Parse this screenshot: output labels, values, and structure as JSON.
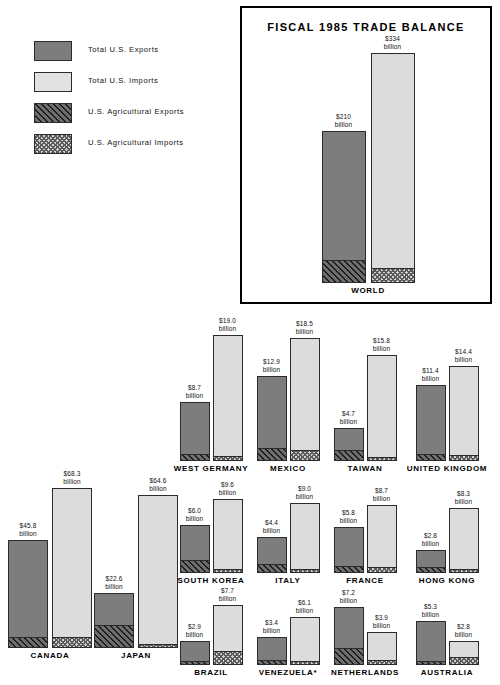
{
  "legend": {
    "items": [
      {
        "label": "Total U.S. Exports",
        "swatch": "solid-dark-gray"
      },
      {
        "label": "Total U.S. Imports",
        "swatch": "solid-light-gray"
      },
      {
        "label": "U.S. Agricultural Exports",
        "swatch": "diagonal-hatch"
      },
      {
        "label": "U.S. Agricultural Imports",
        "swatch": "checkerboard"
      }
    ]
  },
  "world_panel": {
    "title": "FISCAL 1985 TRADE BALANCE",
    "country": "WORLD",
    "export_label": "$210",
    "export_unit": "billion",
    "import_label": "$334",
    "import_unit": "billion"
  },
  "unit_word": "billion",
  "colors": {
    "exports": "#7d7d7d",
    "imports": "#dcdcdc",
    "outline": "#2b2b2b",
    "panel_border": "#000000"
  },
  "chart_data": {
    "type": "bar",
    "title": "FISCAL 1985 TRADE BALANCE",
    "subtitle": "",
    "xlabel": "",
    "ylabel": "",
    "units": "billions of U.S. dollars",
    "grid": false,
    "legend_position": "top-left",
    "series": [
      {
        "name": "Total U.S. Exports",
        "key": "exports"
      },
      {
        "name": "Total U.S. Imports",
        "key": "imports"
      },
      {
        "name": "U.S. Agricultural Exports",
        "key": "ag_exports"
      },
      {
        "name": "U.S. Agricultural Imports",
        "key": "ag_imports"
      }
    ],
    "categories": [
      "WORLD",
      "CANADA",
      "JAPAN",
      "WEST GERMANY",
      "MEXICO",
      "TAIWAN",
      "UNITED KINGDOM",
      "SOUTH KOREA",
      "ITALY",
      "FRANCE",
      "HONG KONG",
      "BRAZIL",
      "VENEZUELA*",
      "NETHERLANDS",
      "AUSTRALIA"
    ],
    "points": [
      {
        "country": "WORLD",
        "exports": 210,
        "imports": 334,
        "export_text": "$210",
        "import_text": "$334",
        "ag_export_frac": 0.145,
        "ag_import_frac": 0.06
      },
      {
        "country": "CANADA",
        "exports": 45.8,
        "imports": 68.3,
        "export_text": "$45.8",
        "import_text": "$68.3",
        "ag_export_frac": 0.095,
        "ag_import_frac": 0.065
      },
      {
        "country": "JAPAN",
        "exports": 22.6,
        "imports": 64.6,
        "export_text": "$22.6",
        "import_text": "$64.6",
        "ag_export_frac": 0.4,
        "ag_import_frac": 0.012
      },
      {
        "country": "WEST GERMANY",
        "exports": 8.7,
        "imports": 19.0,
        "export_text": "$8.7",
        "import_text": "$19.0",
        "ag_export_frac": 0.1,
        "ag_import_frac": 0.035
      },
      {
        "country": "MEXICO",
        "exports": 12.9,
        "imports": 18.5,
        "export_text": "$12.9",
        "import_text": "$18.5",
        "ag_export_frac": 0.145,
        "ag_import_frac": 0.085
      },
      {
        "country": "TAIWAN",
        "exports": 4.7,
        "imports": 15.8,
        "export_text": "$4.7",
        "import_text": "$15.8",
        "ag_export_frac": 0.29,
        "ag_import_frac": 0.025
      },
      {
        "country": "UNITED KINGDOM",
        "exports": 11.4,
        "imports": 14.4,
        "export_text": "$11.4",
        "import_text": "$14.4",
        "ag_export_frac": 0.075,
        "ag_import_frac": 0.055
      },
      {
        "country": "SOUTH KOREA",
        "exports": 6.0,
        "imports": 9.6,
        "export_text": "$6.0",
        "import_text": "$9.6",
        "ag_export_frac": 0.26,
        "ag_import_frac": 0.035
      },
      {
        "country": "ITALY",
        "exports": 4.4,
        "imports": 9.0,
        "export_text": "$4.4",
        "import_text": "$9.0",
        "ag_export_frac": 0.22,
        "ag_import_frac": 0.045
      },
      {
        "country": "FRANCE",
        "exports": 5.8,
        "imports": 8.7,
        "export_text": "$5.8",
        "import_text": "$8.7",
        "ag_export_frac": 0.13,
        "ag_import_frac": 0.075
      },
      {
        "country": "HONG KONG",
        "exports": 2.8,
        "imports": 8.3,
        "export_text": "$2.8",
        "import_text": "$8.3",
        "ag_export_frac": 0.22,
        "ag_import_frac": 0.018
      },
      {
        "country": "BRAZIL",
        "exports": 2.9,
        "imports": 7.7,
        "export_text": "$2.9",
        "import_text": "$7.7",
        "ag_export_frac": 0.12,
        "ag_import_frac": 0.22
      },
      {
        "country": "VENEZUELA*",
        "exports": 3.4,
        "imports": 6.1,
        "export_text": "$3.4",
        "import_text": "$6.1",
        "ag_export_frac": 0.16,
        "ag_import_frac": 0.02
      },
      {
        "country": "NETHERLANDS",
        "exports": 7.2,
        "imports": 3.9,
        "export_text": "$7.2",
        "import_text": "$3.9",
        "ag_export_frac": 0.28,
        "ag_import_frac": 0.13
      },
      {
        "country": "AUSTRALIA",
        "exports": 5.3,
        "imports": 2.8,
        "export_text": "$5.3",
        "import_text": "$2.8",
        "ag_export_frac": 0.055,
        "ag_import_frac": 0.3
      }
    ]
  },
  "layout": {
    "groups": [
      {
        "country": "CANADA",
        "cx": 50,
        "baseline": 648,
        "bw": 40,
        "gap": 4,
        "eh": 108,
        "ih": 160,
        "scale": "tall"
      },
      {
        "country": "JAPAN",
        "cx": 136,
        "baseline": 648,
        "bw": 40,
        "gap": 4,
        "eh": 55,
        "ih": 153,
        "scale": "tall"
      },
      {
        "country": "WEST GERMANY",
        "cx": 211,
        "baseline": 461,
        "bw": 30,
        "gap": 3,
        "eh": 59,
        "ih": 126
      },
      {
        "country": "MEXICO",
        "cx": 288,
        "baseline": 461,
        "bw": 30,
        "gap": 3,
        "eh": 85,
        "ih": 123
      },
      {
        "country": "TAIWAN",
        "cx": 365,
        "baseline": 461,
        "bw": 30,
        "gap": 3,
        "eh": 33,
        "ih": 106
      },
      {
        "country": "UNITED KINGDOM",
        "cx": 447,
        "baseline": 461,
        "bw": 30,
        "gap": 3,
        "eh": 76,
        "ih": 95
      },
      {
        "country": "SOUTH KOREA",
        "cx": 211,
        "baseline": 573,
        "bw": 30,
        "gap": 3,
        "eh": 48,
        "ih": 74
      },
      {
        "country": "ITALY",
        "cx": 288,
        "baseline": 573,
        "bw": 30,
        "gap": 3,
        "eh": 36,
        "ih": 70
      },
      {
        "country": "FRANCE",
        "cx": 365,
        "baseline": 573,
        "bw": 30,
        "gap": 3,
        "eh": 46,
        "ih": 68
      },
      {
        "country": "HONG KONG",
        "cx": 447,
        "baseline": 573,
        "bw": 30,
        "gap": 3,
        "eh": 23,
        "ih": 65
      },
      {
        "country": "BRAZIL",
        "cx": 211,
        "baseline": 665,
        "bw": 30,
        "gap": 3,
        "eh": 24,
        "ih": 60
      },
      {
        "country": "VENEZUELA*",
        "cx": 288,
        "baseline": 665,
        "bw": 30,
        "gap": 3,
        "eh": 28,
        "ih": 48
      },
      {
        "country": "NETHERLANDS",
        "cx": 365,
        "baseline": 665,
        "bw": 30,
        "gap": 3,
        "eh": 58,
        "ih": 33
      },
      {
        "country": "AUSTRALIA",
        "cx": 447,
        "baseline": 665,
        "bw": 30,
        "gap": 3,
        "eh": 44,
        "ih": 24
      }
    ],
    "world": {
      "cx": 126,
      "baseline": 275,
      "bw": 44,
      "gap": 5,
      "eh": 152,
      "ih": 230
    }
  }
}
